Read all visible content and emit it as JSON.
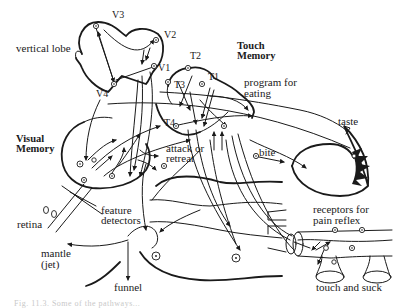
{
  "figure": {
    "regions": {
      "vertical_lobe": "vertical lobe",
      "touch_memory_line1": "Touch",
      "touch_memory_line2": "Memory",
      "visual_memory_line1": "Visual",
      "visual_memory_line2": "Memory"
    },
    "nodes": {
      "v1": "V1",
      "v2": "V2",
      "v3": "V3",
      "v4": "V4",
      "t1": "T1",
      "t2": "T2",
      "t3": "T3",
      "t4": "T4"
    },
    "labels": {
      "program_line1": "program for",
      "program_line2": "eating",
      "taste": "taste",
      "bite": "bite",
      "attack_line1": "attack or",
      "attack_line2": "retreat",
      "receptors_line1": "receptors for",
      "receptors_line2": "pain reflex",
      "feature_line1": "feature",
      "feature_line2": "detectors",
      "retina": "retina",
      "mantle_line1": "mantle",
      "mantle_line2": "(jet)",
      "funnel": "funnel",
      "touch_suck": "touch and suck"
    },
    "caption": "Fig. 11.3. Some of the pathways..."
  },
  "colors": {
    "ink": "#1a1a1a",
    "background": "#ffffff"
  }
}
